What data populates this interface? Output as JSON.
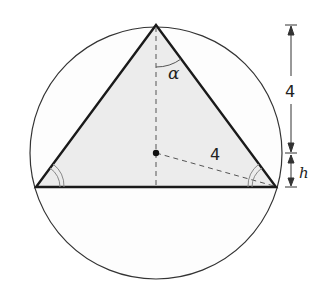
{
  "diagram": {
    "colors": {
      "stroke": "#1a1a1a",
      "triangle_fill": "#ececec",
      "dashed": "#555555",
      "angle_mark": "#888888"
    },
    "labels": {
      "apex_angle": "α",
      "radius": "4",
      "upper_dimension": "4",
      "lower_dimension": "h"
    },
    "circle": {
      "cx": 156,
      "cy": 153,
      "r": 126
    },
    "triangle": {
      "apex": [
        156,
        25
      ],
      "left": [
        36,
        187
      ],
      "right": [
        276,
        187
      ]
    },
    "center_point": [
      156,
      153
    ],
    "dimension_line": {
      "x": 291,
      "top": 25,
      "mid": 153,
      "bottom": 187
    }
  }
}
